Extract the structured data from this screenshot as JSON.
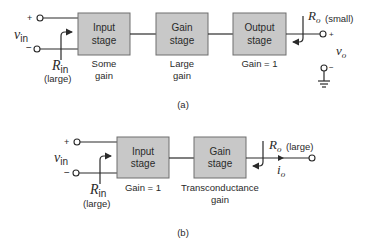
{
  "diagram_a": {
    "caption": "(a)",
    "input": {
      "plus": "+",
      "minus": "−",
      "v_symbol": "v",
      "v_sub": "in",
      "r_symbol": "R",
      "r_sub": "in",
      "r_note": "(large)"
    },
    "blocks": [
      {
        "line1": "Input",
        "line2": "stage",
        "note1": "Some",
        "note2": "gain"
      },
      {
        "line1": "Gain",
        "line2": "stage",
        "note1": "Large",
        "note2": "gain"
      },
      {
        "line1": "Output",
        "line2": "stage",
        "note1": "Gain = 1",
        "note2": ""
      }
    ],
    "output": {
      "r_symbol": "R",
      "r_sub": "o",
      "r_note": "(small)",
      "plus": "+",
      "minus": "−",
      "v_symbol": "v",
      "v_sub": "o"
    }
  },
  "diagram_b": {
    "caption": "(b)",
    "input": {
      "plus": "+",
      "minus": "−",
      "v_symbol": "v",
      "v_sub": "in",
      "r_symbol": "R",
      "r_sub": "in",
      "r_note": "(large)"
    },
    "blocks": [
      {
        "line1": "Input",
        "line2": "stage",
        "note1": "Gain = 1",
        "note2": ""
      },
      {
        "line1": "Gain",
        "line2": "stage",
        "note1": "Transconductance",
        "note2": "gain"
      }
    ],
    "output": {
      "r_symbol": "R",
      "r_sub": "o",
      "r_note": "(large)",
      "i_symbol": "i",
      "i_sub": "o"
    }
  },
  "colors": {
    "block_fill": "#c8c8c8",
    "block_stroke": "#6e6e6e",
    "line": "#2a2a2a"
  }
}
